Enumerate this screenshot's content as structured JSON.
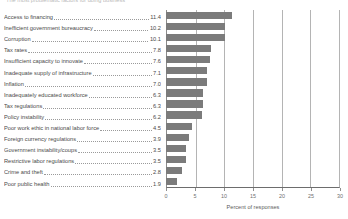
{
  "chart_data": {
    "type": "bar",
    "orientation": "horizontal",
    "title": "The most problematic factors for doing business",
    "xlabel": "Percent of responses",
    "ylabel": "",
    "xlim": [
      0,
      30
    ],
    "xticks": [
      0,
      5,
      10,
      15,
      20,
      25,
      30
    ],
    "xtick_labels": [
      "0",
      "5",
      "10",
      "15",
      "20",
      "25",
      "30"
    ],
    "grid": true,
    "legend": false,
    "bar_color": "#7b7b7b",
    "categories": [
      "Access to financing",
      "Inefficient government bureaucracy",
      "Corruption",
      "Tax rates",
      "Insufficient capacity to innovate",
      "Inadequate supply of infrastructure",
      "Inflation",
      "Inadequately educated workforce",
      "Tax regulations",
      "Policy instability",
      "Poor work ethic in national labor force",
      "Foreign currency regulations",
      "Government instability/coups",
      "Restrictive labor regulations",
      "Crime and theft",
      "Poor public health"
    ],
    "values": [
      11.4,
      10.2,
      10.1,
      7.8,
      7.6,
      7.1,
      7.0,
      6.3,
      6.3,
      6.2,
      4.5,
      3.9,
      3.5,
      3.5,
      2.8,
      1.9
    ],
    "value_labels": [
      "11.4",
      "10.2",
      "10.1",
      "7.8",
      "7.6",
      "7.1",
      "7.0",
      "6.3",
      "6.3",
      "6.2",
      "4.5",
      "3.9",
      "3.5",
      "3.5",
      "2.8",
      "1.9"
    ]
  }
}
